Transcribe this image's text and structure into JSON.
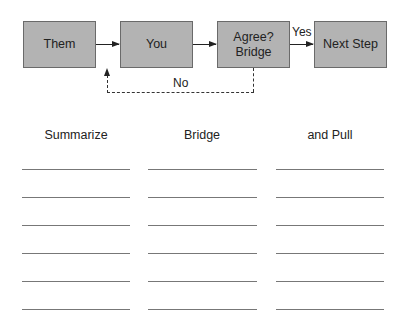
{
  "diagram": {
    "nodes": [
      {
        "id": "them",
        "label": "Them"
      },
      {
        "id": "you",
        "label": "You"
      },
      {
        "id": "agree",
        "label": "Agree?\nBridge",
        "line1": "Agree?",
        "line2": "Bridge"
      },
      {
        "id": "next",
        "label": "Next Step"
      }
    ],
    "edges": [
      {
        "from": "them",
        "to": "you",
        "label": ""
      },
      {
        "from": "you",
        "to": "agree",
        "label": ""
      },
      {
        "from": "agree",
        "to": "next",
        "label": "Yes"
      },
      {
        "from": "agree",
        "to": "you",
        "label": "No",
        "style": "dashed"
      }
    ],
    "yes_label": "Yes",
    "no_label": "No"
  },
  "worksheet": {
    "columns": [
      {
        "header": "Summarize",
        "lines": 6
      },
      {
        "header": "Bridge",
        "lines": 6
      },
      {
        "header": "and Pull",
        "lines": 6
      }
    ]
  },
  "colors": {
    "box_fill": "#b3b3b3",
    "box_border": "#6a6a6a",
    "line": "#777777"
  }
}
